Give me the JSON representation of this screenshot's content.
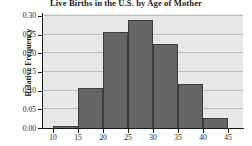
{
  "chart_data": {
    "type": "bar",
    "title": "Live Births in the U.S. by Age of Mother",
    "xlabel": "",
    "ylabel": "Relative Frequency",
    "categories": [
      "10-15",
      "15-20",
      "20-25",
      "25-30",
      "30-35",
      "35-40",
      "40-45"
    ],
    "bin_edges": [
      10,
      15,
      20,
      25,
      30,
      35,
      40,
      45
    ],
    "values": [
      0.006,
      0.106,
      0.257,
      0.288,
      0.225,
      0.118,
      0.026
    ],
    "xlim": [
      8,
      48
    ],
    "ylim": [
      0.0,
      0.305
    ],
    "xticks": [
      "10",
      "15",
      "20",
      "25",
      "30",
      "35",
      "40",
      "45"
    ],
    "xtick_values": [
      10,
      15,
      20,
      25,
      30,
      35,
      40,
      45
    ],
    "yticks": [
      "0.00",
      "0.05",
      "0.10",
      "0.15",
      "0.20",
      "0.25",
      "0.30"
    ],
    "ytick_values": [
      0.0,
      0.05,
      0.1,
      0.15,
      0.2,
      0.25,
      0.3
    ],
    "grid": true,
    "legend": null,
    "bar_color": "#656565",
    "bar_edge_color": "#3d3d3d",
    "plot_background": "#e7e7e7",
    "gridline_color": "#bdbdbd",
    "axis_color": "#1a1a1a",
    "figure_background": "#ffffff"
  }
}
